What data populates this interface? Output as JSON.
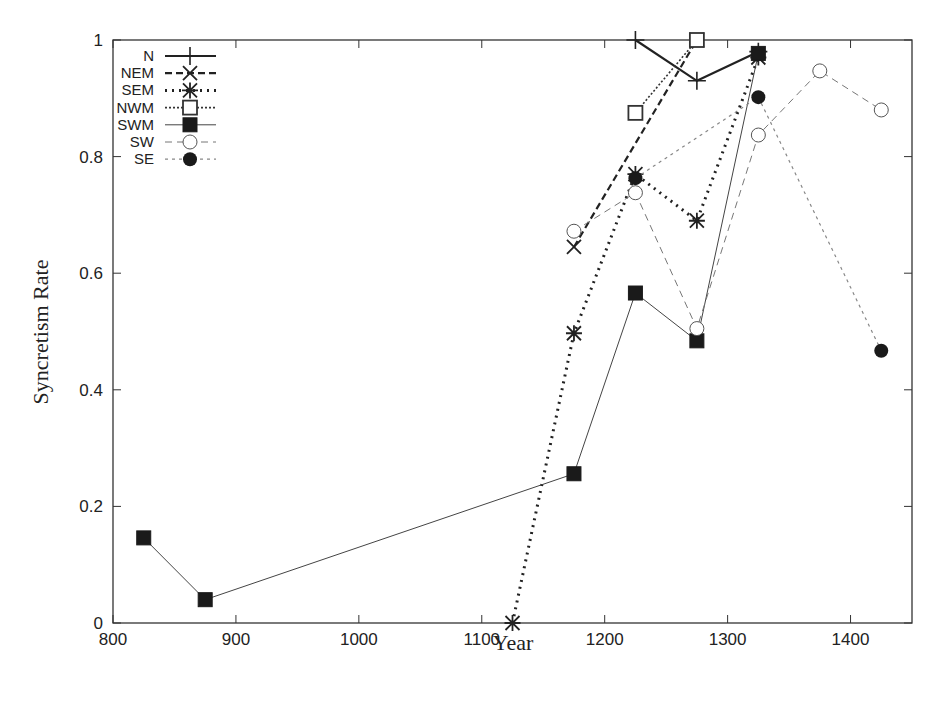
{
  "chart_data": {
    "type": "line",
    "title": "",
    "xlabel": "Year",
    "ylabel": "Syncretism Rate",
    "xlim": [
      800,
      1450
    ],
    "ylim": [
      0,
      1
    ],
    "xticks": [
      800,
      900,
      1000,
      1100,
      1200,
      1300,
      1400
    ],
    "xtick_labels": [
      "800",
      "900",
      "1000",
      "1100",
      "1200",
      "1300",
      "1400"
    ],
    "yticks": [
      0,
      0.2,
      0.4,
      0.6,
      0.8,
      1
    ],
    "ytick_labels": [
      "0",
      "0.2",
      "0.4",
      "0.6",
      "0.8",
      "1"
    ],
    "grid": false,
    "legend_position": "top-left (inside)",
    "series": [
      {
        "name": "N",
        "marker": "plus",
        "line": "solid-thick",
        "color": "#222222",
        "x": [
          1225,
          1275,
          1325
        ],
        "y": [
          1.0,
          0.93,
          0.98
        ]
      },
      {
        "name": "NEM",
        "marker": "x",
        "line": "dashed-thick",
        "color": "#222222",
        "x": [
          1175,
          1275
        ],
        "y": [
          0.645,
          1.0
        ]
      },
      {
        "name": "SEM",
        "marker": "star",
        "line": "dotted-thick",
        "color": "#222222",
        "x": [
          1125,
          1175,
          1225,
          1275,
          1325
        ],
        "y": [
          0.0,
          0.497,
          0.77,
          0.69,
          0.97
        ]
      },
      {
        "name": "NWM",
        "marker": "open-square",
        "line": "dotted",
        "color": "#333333",
        "x": [
          1225,
          1275
        ],
        "y": [
          0.875,
          1.0
        ]
      },
      {
        "name": "SWM",
        "marker": "filled-square",
        "line": "solid-thin",
        "color": "#444444",
        "x": [
          825,
          875,
          1175,
          1225,
          1275,
          1325
        ],
        "y": [
          0.146,
          0.04,
          0.256,
          0.566,
          0.484,
          0.977
        ]
      },
      {
        "name": "SW",
        "marker": "open-circle",
        "line": "dashed-thin",
        "color": "#777777",
        "x": [
          1175,
          1225,
          1275,
          1325,
          1375,
          1425
        ],
        "y": [
          0.672,
          0.738,
          0.505,
          0.837,
          0.947,
          0.88
        ]
      },
      {
        "name": "SE",
        "marker": "filled-circle",
        "line": "dotted-thin",
        "color": "#888888",
        "x": [
          1225,
          1325,
          1425
        ],
        "y": [
          0.763,
          0.902,
          0.467
        ]
      }
    ]
  }
}
